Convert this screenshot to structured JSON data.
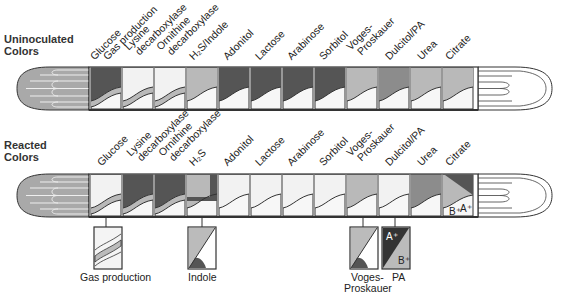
{
  "sections": {
    "uninoculated": {
      "title_line1": "Uninoculated",
      "title_line2": "Colors"
    },
    "reacted": {
      "title_line1": "Reacted",
      "title_line2": "Colors"
    }
  },
  "uninoculated_labels": [
    {
      "line1": "Glucose",
      "line2": ""
    },
    {
      "line1": "Gas production",
      "line2": ""
    },
    {
      "line1": "Lysine",
      "line2": "decarboxylase"
    },
    {
      "line1": "Ornithine",
      "line2": "decarboxylase"
    },
    {
      "line1": "H₂S/Indole",
      "line2": ""
    },
    {
      "line1": "Adonitol",
      "line2": ""
    },
    {
      "line1": "Lactose",
      "line2": ""
    },
    {
      "line1": "Arabinose",
      "line2": ""
    },
    {
      "line1": "Sorbitol",
      "line2": ""
    },
    {
      "line1": "Voges-",
      "line2": "Proskauer"
    },
    {
      "line1": "Dulcitol/PA",
      "line2": ""
    },
    {
      "line1": "Urea",
      "line2": ""
    },
    {
      "line1": "Citrate",
      "line2": ""
    }
  ],
  "reacted_labels": [
    {
      "line1": "Glucose",
      "line2": ""
    },
    {
      "line1": "Lysine",
      "line2": "decarboxylase"
    },
    {
      "line1": "Ornithine",
      "line2": "decarboxylase"
    },
    {
      "line1": "H₂S",
      "line2": ""
    },
    {
      "line1": "Adonitol",
      "line2": ""
    },
    {
      "line1": "Lactose",
      "line2": ""
    },
    {
      "line1": "Arabinose",
      "line2": ""
    },
    {
      "line1": "Sorbitol",
      "line2": ""
    },
    {
      "line1": "Voges-",
      "line2": "Proskauer"
    },
    {
      "line1": "Dulcitol/PA",
      "line2": ""
    },
    {
      "line1": "Urea",
      "line2": ""
    },
    {
      "line1": "Citrate",
      "line2": ""
    }
  ],
  "insets": {
    "gas_production": "Gas production",
    "indole": "Indole",
    "voges_line1": "Voges-",
    "voges_line2": "Proskauer",
    "pa": "PA",
    "pa_a": "A⁺",
    "pa_b": "B⁺",
    "citrate_b": "B⁺",
    "citrate_a": "A⁺"
  },
  "colors": {
    "dark": "#555555",
    "medium": "#8c8c8c",
    "light": "#b9b9b9",
    "pale": "#f2f2f2",
    "outline": "#333333"
  }
}
